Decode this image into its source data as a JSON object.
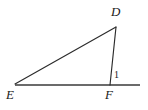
{
  "figure": {
    "kind": "geometry-triangle-with-exterior-ray",
    "background_color": "#ffffff",
    "stroke_color": "#2b2b2b",
    "stroke_width": 1.1,
    "canvas": {
      "width": 148,
      "height": 110
    },
    "points": {
      "D": {
        "x": 116,
        "y": 27
      },
      "E": {
        "x": 15,
        "y": 84
      },
      "F": {
        "x": 110,
        "y": 84
      },
      "baseline_right_end": {
        "x": 140,
        "y": 85
      },
      "baseline_left_end": {
        "x": 15,
        "y": 85
      }
    },
    "segments": [
      {
        "name": "segment-ED",
        "from": "E",
        "to": "D"
      },
      {
        "name": "segment-DF",
        "from": "D",
        "to": "F"
      },
      {
        "name": "segment-EF-baseline",
        "from": "baseline_left_end",
        "to": "baseline_right_end"
      }
    ],
    "vertex_labels": [
      {
        "id": "D",
        "text": "D"
      },
      {
        "id": "E",
        "text": "E"
      },
      {
        "id": "F",
        "text": "F"
      }
    ],
    "angle_labels": [
      {
        "id": "1",
        "text": "1"
      }
    ]
  }
}
